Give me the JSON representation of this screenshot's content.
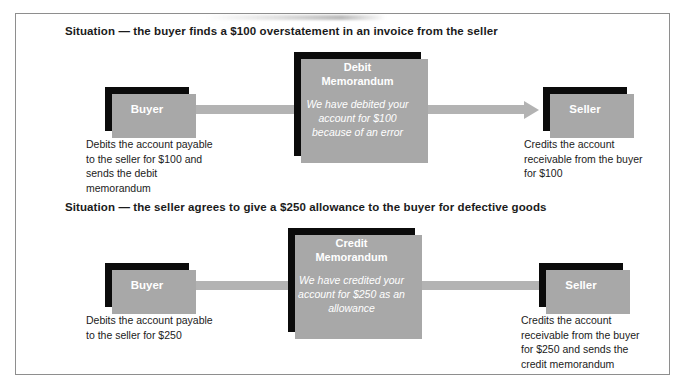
{
  "figure": {
    "panels": [
      {
        "situation": "Situation — the buyer finds a $100 overstatement in an invoice from the seller",
        "left_party": "Buyer",
        "right_party": "Seller",
        "memo_title_line1": "Debit",
        "memo_title_line2": "Memorandum",
        "memo_body": "We have debited your account for $100 because of an error",
        "left_caption": "Debits the account payable to the seller for $100 and sends the debit memorandum",
        "right_caption": "Credits the account receivable from the buyer for $100",
        "arrow_direction": "right"
      },
      {
        "situation": "Situation — the seller agrees to give a $250 allowance to the buyer for defective goods",
        "left_party": "Buyer",
        "right_party": "Seller",
        "memo_title_line1": "Credit",
        "memo_title_line2": "Memorandum",
        "memo_body": "We have credited your account for $250 as an allowance",
        "left_caption": "Debits the account payable to the seller for $250",
        "right_caption": "Credits the account receivable from the buyer for $250 and sends the credit memorandum",
        "arrow_direction": "left"
      }
    ],
    "colors": {
      "box_fill": "#0b0b0b",
      "box_shadow": "#a8a8a8",
      "arrow": "#b3b3b3",
      "border": "#8e8e8e",
      "text": "#1b1b1b",
      "box_text": "#ffffff"
    }
  }
}
